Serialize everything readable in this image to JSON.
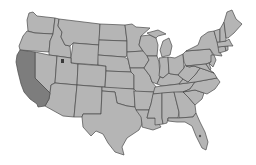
{
  "map": {
    "title": "United States",
    "highlighted_state": "California",
    "colors": {
      "default_fill": "#b5b5b5",
      "highlight_fill": "#7d7d7d",
      "border": "#4a4a4a",
      "background": "#ffffff"
    },
    "states": [
      {
        "id": "WA",
        "name": "Washington"
      },
      {
        "id": "OR",
        "name": "Oregon"
      },
      {
        "id": "CA",
        "name": "California",
        "highlighted": true
      },
      {
        "id": "ID",
        "name": "Idaho"
      },
      {
        "id": "NV",
        "name": "Nevada"
      },
      {
        "id": "MT",
        "name": "Montana"
      },
      {
        "id": "WY",
        "name": "Wyoming"
      },
      {
        "id": "UT",
        "name": "Utah"
      },
      {
        "id": "AZ",
        "name": "Arizona"
      },
      {
        "id": "CO",
        "name": "Colorado"
      },
      {
        "id": "NM",
        "name": "New Mexico"
      },
      {
        "id": "ND",
        "name": "North Dakota"
      },
      {
        "id": "SD",
        "name": "South Dakota"
      },
      {
        "id": "NE",
        "name": "Nebraska"
      },
      {
        "id": "KS",
        "name": "Kansas"
      },
      {
        "id": "OK",
        "name": "Oklahoma"
      },
      {
        "id": "TX",
        "name": "Texas"
      },
      {
        "id": "MN",
        "name": "Minnesota"
      },
      {
        "id": "IA",
        "name": "Iowa"
      },
      {
        "id": "MO",
        "name": "Missouri"
      },
      {
        "id": "AR",
        "name": "Arkansas"
      },
      {
        "id": "LA",
        "name": "Louisiana"
      },
      {
        "id": "WI",
        "name": "Wisconsin"
      },
      {
        "id": "IL",
        "name": "Illinois"
      },
      {
        "id": "MI",
        "name": "Michigan"
      },
      {
        "id": "IN",
        "name": "Indiana"
      },
      {
        "id": "OH",
        "name": "Ohio"
      },
      {
        "id": "KY",
        "name": "Kentucky"
      },
      {
        "id": "TN",
        "name": "Tennessee"
      },
      {
        "id": "MS",
        "name": "Mississippi"
      },
      {
        "id": "AL",
        "name": "Alabama"
      },
      {
        "id": "GA",
        "name": "Georgia"
      },
      {
        "id": "FL",
        "name": "Florida"
      },
      {
        "id": "SC",
        "name": "South Carolina"
      },
      {
        "id": "NC",
        "name": "North Carolina"
      },
      {
        "id": "VA",
        "name": "Virginia"
      },
      {
        "id": "WV",
        "name": "West Virginia"
      },
      {
        "id": "PA",
        "name": "Pennsylvania"
      },
      {
        "id": "NY",
        "name": "New York"
      },
      {
        "id": "VT",
        "name": "Vermont"
      },
      {
        "id": "NH",
        "name": "New Hampshire"
      },
      {
        "id": "ME",
        "name": "Maine"
      },
      {
        "id": "MA",
        "name": "Massachusetts"
      },
      {
        "id": "CT",
        "name": "Connecticut"
      },
      {
        "id": "RI",
        "name": "Rhode Island"
      },
      {
        "id": "NJ",
        "name": "New Jersey"
      },
      {
        "id": "DE",
        "name": "Delaware"
      },
      {
        "id": "MD",
        "name": "Maryland"
      }
    ]
  }
}
